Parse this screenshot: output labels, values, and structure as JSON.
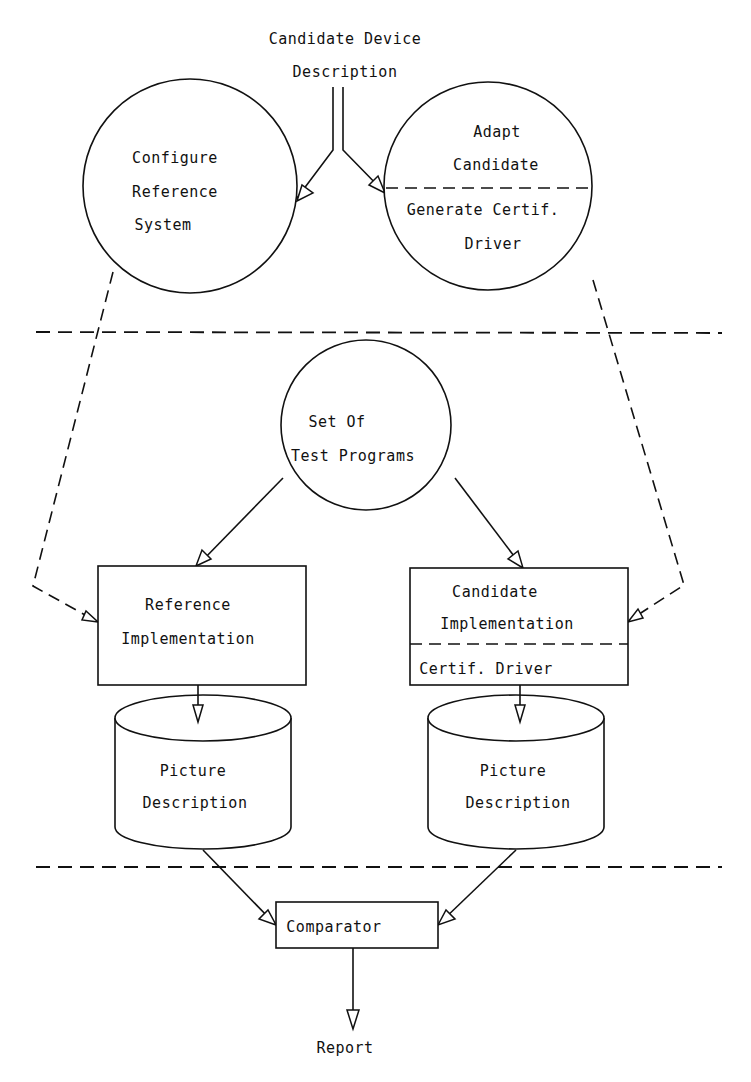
{
  "diagram": {
    "title_line1": "Candidate Device",
    "title_line2": "Description",
    "configure_reference": {
      "line1": "Configure",
      "line2": "Reference",
      "line3": "System"
    },
    "adapt_candidate": {
      "line1": "Adapt",
      "line2": "Candidate",
      "line3": "Generate Certif.",
      "line4": "Driver"
    },
    "test_programs": {
      "line1": "Set Of",
      "line2": "Test Programs"
    },
    "reference_implementation": {
      "line1": "Reference",
      "line2": "Implementation"
    },
    "candidate_implementation": {
      "line1": "Candidate",
      "line2": "Implementation",
      "line3": "Certif. Driver"
    },
    "picture_description_left": {
      "line1": "Picture",
      "line2": "Description"
    },
    "picture_description_right": {
      "line1": "Picture",
      "line2": "Description"
    },
    "comparator": {
      "label": "Comparator"
    },
    "report": {
      "label": "Report"
    }
  },
  "colors": {
    "ink": "#111111",
    "background": "#ffffff"
  }
}
